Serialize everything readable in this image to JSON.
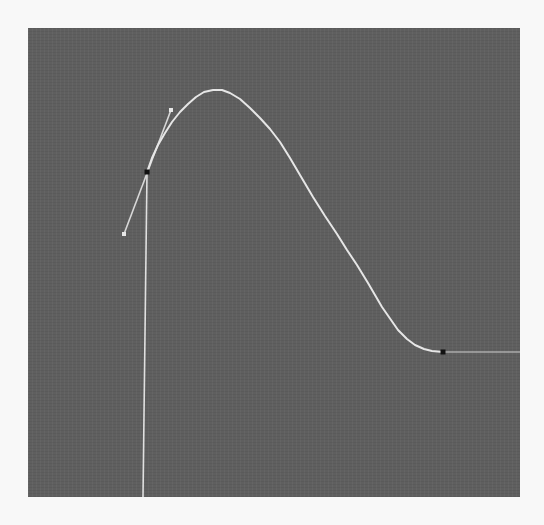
{
  "editor": {
    "type": "curve-graph-editor",
    "panel_color": "#5f5f5f",
    "curve_color": "#e6e6e6",
    "key_color": "#111111",
    "handle_color": "#d8d8d8"
  },
  "curve": {
    "keyframes": [
      {
        "id": "key-1",
        "x": 147,
        "y": 172,
        "handle_in": {
          "x": 124,
          "y": 234
        },
        "handle_out": {
          "x": 171,
          "y": 110
        }
      },
      {
        "id": "key-2",
        "x": 443,
        "y": 352
      }
    ],
    "points": [
      [
        147,
        172
      ],
      [
        152,
        158
      ],
      [
        158,
        145
      ],
      [
        165,
        133
      ],
      [
        172,
        122
      ],
      [
        180,
        112
      ],
      [
        188,
        104
      ],
      [
        196,
        97
      ],
      [
        204,
        92
      ],
      [
        213,
        90
      ],
      [
        222,
        90
      ],
      [
        230,
        93
      ],
      [
        240,
        99
      ],
      [
        250,
        108
      ],
      [
        260,
        118
      ],
      [
        270,
        129
      ],
      [
        280,
        142
      ],
      [
        290,
        158
      ],
      [
        300,
        175
      ],
      [
        313,
        197
      ],
      [
        325,
        216
      ],
      [
        337,
        234
      ],
      [
        347,
        250
      ],
      [
        357,
        265
      ],
      [
        368,
        283
      ],
      [
        382,
        307
      ],
      [
        398,
        330
      ],
      [
        407,
        339
      ],
      [
        415,
        345
      ],
      [
        424,
        349
      ],
      [
        432,
        351
      ],
      [
        443,
        352
      ]
    ],
    "pre_extrapolation": {
      "from": [
        147,
        172
      ],
      "to": [
        143,
        497
      ]
    },
    "post_extrapolation": {
      "from": [
        443,
        352
      ],
      "to": [
        520,
        352
      ]
    }
  }
}
